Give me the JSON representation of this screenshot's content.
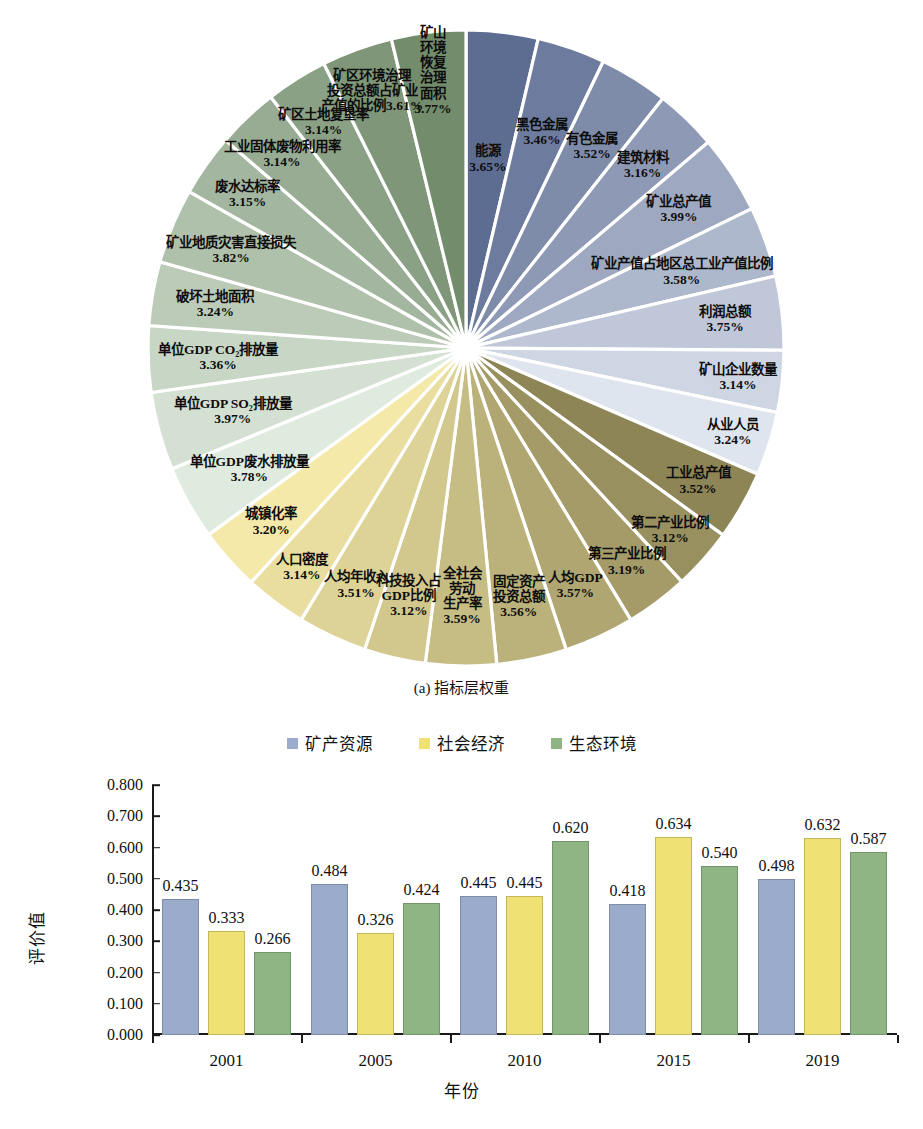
{
  "figure_a": {
    "caption": "(a) 指标层权重",
    "chart_type": "pie",
    "groups": [
      {
        "name": "矿产资源",
        "color_start": "#5d6d92",
        "color_end": "#dfe5ef"
      },
      {
        "name": "社会经济",
        "color_start": "#8d8556",
        "color_end": "#f4e9a8"
      },
      {
        "name": "生态环境",
        "color_start": "#e0ebdf",
        "color_end": "#738c6b"
      }
    ]
  },
  "chart_data": [
    {
      "type": "pie",
      "title": "(a) 指标层权重",
      "legend": "none",
      "unit": "%",
      "labels": [
        "能源",
        "黑色金属",
        "有色金属",
        "建筑材料",
        "矿业总产值",
        "矿业产值占地区总工业产值比例",
        "利润总额",
        "矿山企业数量",
        "从业人员",
        "工业总产值",
        "第二产业比例",
        "第三产业比例",
        "人均GDP",
        "固定资产投资总额",
        "全社会劳动生产率",
        "科技投入占GDP比例",
        "人均年收入",
        "人口密度",
        "城镇化率",
        "单位GDP废水排放量",
        "单位GDP SO₂排放量",
        "单位GDP CO₂排放量",
        "破坏土地面积",
        "矿业地质灾害直接损失",
        "废水达标率",
        "工业固体废物利用率",
        "矿区土地复垦率",
        "矿区环境治理投资总额占矿业产值的比例",
        "矿山环境恢复治理面积"
      ],
      "values": [
        3.65,
        3.46,
        3.52,
        3.16,
        3.99,
        3.58,
        3.75,
        3.14,
        3.24,
        3.52,
        3.12,
        3.19,
        3.57,
        3.56,
        3.59,
        3.12,
        3.51,
        3.14,
        3.2,
        3.78,
        3.97,
        3.36,
        3.24,
        3.82,
        3.15,
        3.14,
        3.14,
        3.61,
        3.77
      ],
      "value_labels": [
        "3.65%",
        "3.46%",
        "3.52%",
        "3.16%",
        "3.99%",
        "3.58%",
        "3.75%",
        "3.14%",
        "3.24%",
        "3.52%",
        "3.12%",
        "3.19%",
        "3.57%",
        "3.56%",
        "3.59%",
        "3.12%",
        "3.51%",
        "3.14%",
        "3.20%",
        "3.78%",
        "3.97%",
        "3.36%",
        "3.24%",
        "3.82%",
        "3.15%",
        "3.14%",
        "3.14%",
        "3.61%",
        "3.77%"
      ],
      "group_of_slice": [
        "矿产资源",
        "矿产资源",
        "矿产资源",
        "矿产资源",
        "矿产资源",
        "矿产资源",
        "矿产资源",
        "矿产资源",
        "矿产资源",
        "社会经济",
        "社会经济",
        "社会经济",
        "社会经济",
        "社会经济",
        "社会经济",
        "社会经济",
        "社会经济",
        "社会经济",
        "社会经济",
        "生态环境",
        "生态环境",
        "生态环境",
        "生态环境",
        "生态环境",
        "生态环境",
        "生态环境",
        "生态环境",
        "生态环境",
        "生态环境"
      ]
    },
    {
      "type": "bar",
      "title": "(b) 矿产资源、社会经济和生态环境评价值",
      "xlabel": "年份",
      "ylabel": "评价值",
      "categories": [
        "2001",
        "2005",
        "2010",
        "2015",
        "2019"
      ],
      "ylim": [
        0.0,
        0.8
      ],
      "ytick_labels": [
        "0.800",
        "0.700",
        "0.600",
        "0.500",
        "0.400",
        "0.300",
        "0.200",
        "0.100",
        "0.000"
      ],
      "ytick_values": [
        0.8,
        0.7,
        0.6,
        0.5,
        0.4,
        0.3,
        0.2,
        0.1,
        0.0
      ],
      "grid": false,
      "legend_position": "top-center",
      "series": [
        {
          "name": "矿产资源",
          "color": "#9aabcb",
          "values": [
            0.435,
            0.484,
            0.445,
            0.418,
            0.498
          ],
          "value_labels": [
            "0.435",
            "0.484",
            "0.445",
            "0.418",
            "0.498"
          ]
        },
        {
          "name": "社会经济",
          "color": "#f0e175",
          "values": [
            0.333,
            0.326,
            0.445,
            0.634,
            0.632
          ],
          "value_labels": [
            "0.333",
            "0.326",
            "0.445",
            "0.634",
            "0.632"
          ]
        },
        {
          "name": "生态环境",
          "color": "#8eb583",
          "values": [
            0.266,
            0.424,
            0.62,
            0.54,
            0.587
          ],
          "value_labels": [
            "0.266",
            "0.424",
            "0.620",
            "0.540",
            "0.587"
          ]
        }
      ]
    }
  ],
  "figure_b": {
    "caption": "(b) 矿产资源、社会经济和生态环境评价值",
    "legend": [
      {
        "label": "矿产资源",
        "color": "#9aabcb"
      },
      {
        "label": "社会经济",
        "color": "#f0e175"
      },
      {
        "label": "生态环境",
        "color": "#8eb583"
      }
    ],
    "ylabel": "评价值",
    "xlabel": "年份"
  }
}
